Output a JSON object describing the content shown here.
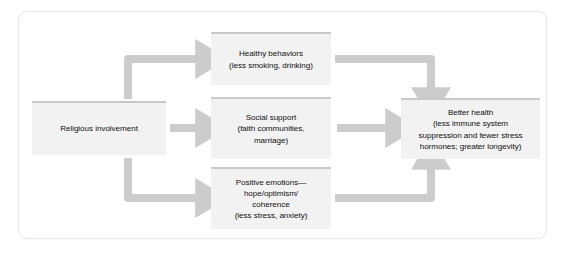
{
  "diagram": {
    "colors": {
      "frame_border": "#e6e6e6",
      "node_fill": "#f2f2f2",
      "node_top_bar": "#c9c9c9",
      "arrow": "#cccccc",
      "text": "#111111",
      "background": "#ffffff"
    },
    "nodes": [
      {
        "id": "religious-involvement",
        "label": "Religious involvement"
      },
      {
        "id": "healthy-behaviors",
        "label": "Healthy behaviors\n(less smoking, drinking)"
      },
      {
        "id": "social-support",
        "label": "Social support\n(faith communities,\nmarriage)"
      },
      {
        "id": "positive-emotions",
        "label": "Positive emotions—\nhope/optimism/\ncoherence\n(less stress, anxiety)"
      },
      {
        "id": "better-health",
        "label": "Better health\n(less immune system\nsuppression and fewer stress\nhormones; greater longevity)"
      }
    ],
    "arrows": [
      {
        "id": "religious-to-healthy",
        "from": "religious-involvement",
        "to": "healthy-behaviors",
        "shape": "elbow-up-right"
      },
      {
        "id": "religious-to-social",
        "from": "religious-involvement",
        "to": "social-support",
        "shape": "straight-right"
      },
      {
        "id": "religious-to-positive",
        "from": "religious-involvement",
        "to": "positive-emotions",
        "shape": "elbow-down-right"
      },
      {
        "id": "healthy-to-better",
        "from": "healthy-behaviors",
        "to": "better-health",
        "shape": "elbow-right-down"
      },
      {
        "id": "social-to-better",
        "from": "social-support",
        "to": "better-health",
        "shape": "straight-right"
      },
      {
        "id": "positive-to-better",
        "from": "positive-emotions",
        "to": "better-health",
        "shape": "elbow-right-up"
      }
    ]
  }
}
